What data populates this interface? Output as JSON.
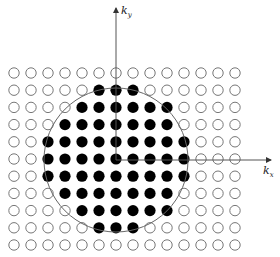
{
  "diagram": {
    "type": "k-space lattice with circular Fermi surface",
    "axes": {
      "x_label": "k",
      "x_subscript": "x",
      "y_label": "k",
      "y_subscript": "y",
      "origin": [
        116,
        160
      ],
      "x_end": [
        271,
        160
      ],
      "y_end": [
        116,
        8
      ],
      "color": "#555555"
    },
    "circle": {
      "cx": 116,
      "cy": 160,
      "r": 72,
      "color": "#666666"
    },
    "grid": {
      "columns": 14,
      "rows": 11,
      "x0": 14,
      "y0": 73,
      "dx": 17.0,
      "dy": 17.2,
      "dot_radius": 5.2,
      "open_color": "#777777",
      "filled_color": "#000000"
    },
    "filled_ranges": [
      null,
      [
        5,
        7
      ],
      [
        4,
        9
      ],
      [
        3,
        9
      ],
      [
        2,
        10
      ],
      [
        2,
        10
      ],
      [
        2,
        10
      ],
      [
        3,
        9
      ],
      [
        4,
        9
      ],
      [
        5,
        7
      ],
      null
    ]
  }
}
